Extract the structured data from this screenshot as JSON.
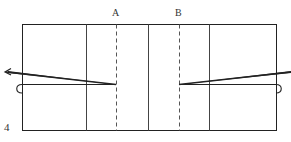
{
  "figure": {
    "number": "4",
    "labels": {
      "fold_a": "A",
      "fold_b": "B"
    },
    "colors": {
      "line": "#222222",
      "fold_line": "#555555",
      "background": "#ffffff"
    },
    "elements": {
      "rectangle": "outer paper rectangle",
      "solid_creases": 3,
      "dashed_fold_lines": [
        "A",
        "B"
      ],
      "arrows": [
        "left pull arrow",
        "right pull line"
      ],
      "hooks": [
        "left edge hook",
        "right edge hook"
      ]
    }
  }
}
